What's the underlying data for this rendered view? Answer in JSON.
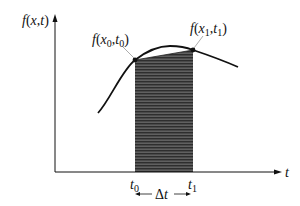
{
  "diagram": {
    "y_axis_label": {
      "f": "f",
      "open": "(",
      "x": "x",
      "comma": ",",
      "t": "t",
      "close": ")"
    },
    "x_axis_label": "t",
    "point0": {
      "f": "f",
      "open": "(",
      "x": "x",
      "xsub": "0",
      "comma": ",",
      "t": "t",
      "tsub": "0",
      "close": ")"
    },
    "point1": {
      "f": "f",
      "open": "(",
      "x": "x",
      "xsub": "1",
      "comma": ",",
      "t": "t",
      "tsub": "1",
      "close": ")"
    },
    "tick0": {
      "t": "t",
      "sub": "0"
    },
    "tick1": {
      "t": "t",
      "sub": "1"
    },
    "interval_label": {
      "delta": "Δ",
      "t": "t"
    },
    "colors": {
      "line": "#111111",
      "shade_dark": "#3a3a3a",
      "shade_light": "#6a6a6a",
      "background": "#ffffff"
    }
  }
}
